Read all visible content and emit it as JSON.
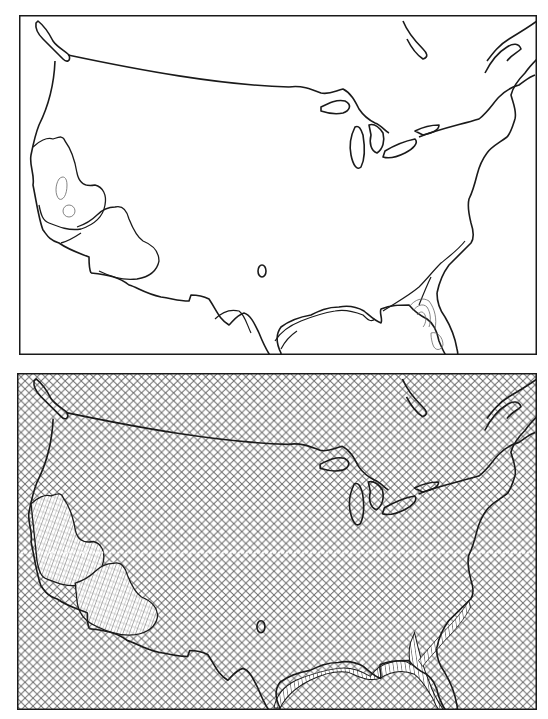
{
  "figure": {
    "panels": [
      {
        "id": "top",
        "description": "Contour map of contiguous United States with hachured isolines",
        "style": "contour-lines",
        "frame": {
          "x": 19,
          "y": 15,
          "w": 518,
          "h": 340
        },
        "regions": [
          "california-central-valley-closed-contour",
          "southern-california-nevada-lobe",
          "gulf-coast-band",
          "atlantic-coastal-plain-band",
          "florida-peninsula-concentric-contours",
          "small-isolated-oval-texas"
        ]
      },
      {
        "id": "bottom",
        "description": "Same map shaded with crosshatch fill; highlighted regions use finer diagonal/vertical hatching",
        "style": "crosshatch-fill",
        "frame": {
          "x": 17,
          "y": 373,
          "w": 520,
          "h": 337
        },
        "regions": [
          "california-fine-hatch",
          "southwest-fine-hatch",
          "gulf-coast-vertical-hatch",
          "florida-vertical-hatch",
          "atlantic-coast-hatch"
        ]
      }
    ],
    "colors": {
      "line": "#1a1a1a",
      "fine_line": "#555555",
      "background": "#ffffff",
      "hatch": "#6b6b6b"
    }
  }
}
